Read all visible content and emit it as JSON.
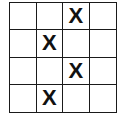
{
  "grid": {
    "rows": 4,
    "cols": 4,
    "mark": "X",
    "cells": [
      [
        "",
        "",
        "X",
        ""
      ],
      [
        "",
        "X",
        "",
        ""
      ],
      [
        "",
        "",
        "X",
        ""
      ],
      [
        "",
        "X",
        "",
        ""
      ]
    ]
  }
}
